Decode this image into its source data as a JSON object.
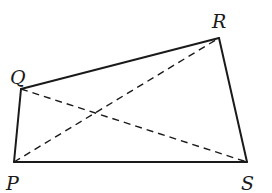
{
  "diagram": {
    "type": "quadrilateral",
    "name": "PQRS",
    "vertices": [
      {
        "label": "P",
        "x": 14,
        "y": 162,
        "label_x": 6,
        "label_y": 190
      },
      {
        "label": "Q",
        "x": 21,
        "y": 89,
        "label_x": 10,
        "label_y": 84
      },
      {
        "label": "R",
        "x": 219,
        "y": 38,
        "label_x": 212,
        "label_y": 28
      },
      {
        "label": "S",
        "x": 247,
        "y": 162,
        "label_x": 241,
        "label_y": 190
      }
    ],
    "sides": [
      {
        "from": "P",
        "to": "Q",
        "style": "solid"
      },
      {
        "from": "Q",
        "to": "R",
        "style": "solid"
      },
      {
        "from": "R",
        "to": "S",
        "style": "solid"
      },
      {
        "from": "S",
        "to": "P",
        "style": "solid"
      }
    ],
    "diagonals": [
      {
        "from": "P",
        "to": "R",
        "style": "dashed"
      },
      {
        "from": "Q",
        "to": "S",
        "style": "dashed"
      }
    ],
    "colors": {
      "stroke": "#1a1a1a",
      "background": "#ffffff"
    }
  }
}
